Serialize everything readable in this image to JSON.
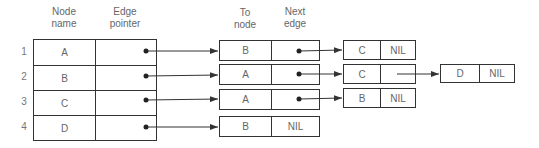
{
  "headers": {
    "node_name": [
      "Node",
      "name"
    ],
    "edge_pointer": [
      "Edge",
      "pointer"
    ],
    "to_node": [
      "To",
      "node"
    ],
    "next_edge": [
      "Next",
      "edge"
    ]
  },
  "node_table": [
    {
      "index": "1",
      "name": "A",
      "pointer": "dot"
    },
    {
      "index": "2",
      "name": "B",
      "pointer": "dot"
    },
    {
      "index": "3",
      "name": "C",
      "pointer": "dot"
    },
    {
      "index": "4",
      "name": "D",
      "pointer": "dot"
    }
  ],
  "edge_lists": [
    [
      {
        "to": "B",
        "next": "dot"
      },
      {
        "to": "C",
        "next": "NIL"
      }
    ],
    [
      {
        "to": "A",
        "next": "dot"
      },
      {
        "to": "C",
        "next": "dot"
      },
      {
        "to": "D",
        "next": "NIL"
      }
    ],
    [
      {
        "to": "A",
        "next": "dot"
      },
      {
        "to": "B",
        "next": "NIL"
      }
    ],
    [
      {
        "to": "B",
        "next": "NIL"
      }
    ]
  ],
  "colors": {
    "line": "#333333",
    "text": "#666666"
  }
}
